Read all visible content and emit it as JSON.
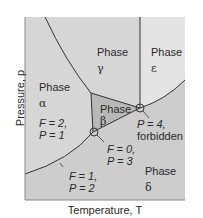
{
  "figure": {
    "x_axis_label": "Temperature, T",
    "y_axis_label": "Pressure, p",
    "colors": {
      "frame_bg": "#d9d9d9",
      "alpha_gamma_delta_fill": "#d6d6d6",
      "epsilon_fill": "#e6e6e6",
      "beta_fill": "#bdbdbd",
      "lower_fill": "#cfcfcf",
      "line": "#3a3a3a"
    },
    "phases": {
      "alpha": {
        "word": "Phase",
        "symbol": "α"
      },
      "beta": {
        "word": "Phase",
        "symbol": "β"
      },
      "gamma": {
        "word": "Phase",
        "symbol": "γ"
      },
      "delta": {
        "word": "Phase",
        "symbol": "δ"
      },
      "epsilon": {
        "word": "Phase",
        "symbol": "ε"
      }
    },
    "annotations": {
      "single_phase": {
        "f": "F = 2,",
        "p": "P = 1"
      },
      "two_phase": {
        "f": "F = 1,",
        "p": "P = 2"
      },
      "triple_point": {
        "f": "F = 0,",
        "p": "P = 3"
      },
      "quadruple_point": {
        "p": "P = 4,",
        "note": "forbidden"
      }
    }
  }
}
